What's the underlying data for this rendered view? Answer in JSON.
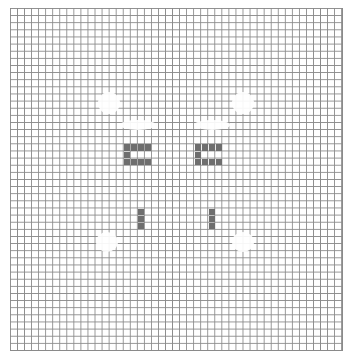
{
  "game": {
    "type": "pixel-grid",
    "columns": 47,
    "rows": 48,
    "colors": {
      "grid_line": "#8a8a8a",
      "filled": "#6e6e6e",
      "background": "#ffffff"
    }
  },
  "filled_cells": [
    [
      16,
      19
    ],
    [
      17,
      19
    ],
    [
      18,
      19
    ],
    [
      19,
      19
    ],
    [
      16,
      20
    ],
    [
      16,
      21
    ],
    [
      17,
      21
    ],
    [
      18,
      21
    ],
    [
      19,
      21
    ],
    [
      26,
      19
    ],
    [
      27,
      19
    ],
    [
      28,
      19
    ],
    [
      29,
      19
    ],
    [
      26,
      20
    ],
    [
      26,
      21
    ],
    [
      27,
      21
    ],
    [
      28,
      21
    ],
    [
      29,
      21
    ],
    [
      18,
      28
    ],
    [
      18,
      29
    ],
    [
      18,
      30
    ],
    [
      28,
      28
    ],
    [
      28,
      29
    ],
    [
      28,
      30
    ]
  ],
  "faded_regions": [
    {
      "x": 98,
      "y": 92,
      "w": 22,
      "h": 22
    },
    {
      "x": 232,
      "y": 92,
      "w": 22,
      "h": 22
    },
    {
      "x": 96,
      "y": 232,
      "w": 22,
      "h": 20
    },
    {
      "x": 232,
      "y": 232,
      "w": 22,
      "h": 20
    },
    {
      "x": 120,
      "y": 120,
      "w": 36,
      "h": 10
    },
    {
      "x": 194,
      "y": 120,
      "w": 36,
      "h": 10
    }
  ]
}
